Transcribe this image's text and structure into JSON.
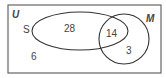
{
  "diagram": {
    "type": "venn",
    "universe_label": "U",
    "sets": [
      {
        "label": "S",
        "only_count": "28"
      },
      {
        "label": "M",
        "only_count": "3"
      }
    ],
    "intersection_count": "14",
    "outside_count": "6"
  }
}
